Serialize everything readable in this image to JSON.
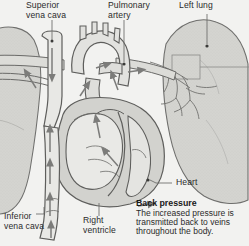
{
  "figure": {
    "type": "anatomical-diagram",
    "style": "grayscale line illustration",
    "background_color": "#f2f2f0",
    "ink_color": "#4a4a4a",
    "tissue_fill": "#cfcfcb",
    "lung_fill": "#d6d6d2",
    "chamber_fill": "#e6e6e3"
  },
  "labels": {
    "superior_vena_cava": "Superior\nvena cava",
    "pulmonary_artery": "Pulmonary\nartery",
    "left_lung": "Left lung",
    "heart": "Heart",
    "inferior_vena_cava": "Inferior\nvena cava",
    "right_ventricle": "Right\nventricle"
  },
  "caption": {
    "title": "Back pressure",
    "line1": "The increased pressure is",
    "line2": "transmitted back to veins",
    "line3": "throughout the body."
  }
}
